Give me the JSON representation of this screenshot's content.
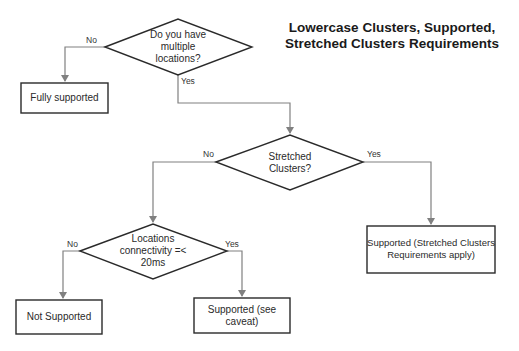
{
  "title": {
    "line1": "Lowercase Clusters, Supported,",
    "line2": "Stretched Clusters Requirements"
  },
  "colors": {
    "background": "#ffffff",
    "shape_stroke": "#2a2a2a",
    "connector": "#808080",
    "text": "#1a1a1a"
  },
  "nodes": {
    "q1": {
      "type": "decision",
      "lines": [
        "Do you have",
        "multiple",
        "locations?"
      ]
    },
    "fully_supported": {
      "type": "process",
      "lines": [
        "Fully supported"
      ]
    },
    "q2": {
      "type": "decision",
      "lines": [
        "Stretched",
        "Clusters?"
      ]
    },
    "supported_stretched": {
      "type": "process",
      "lines": [
        "Supported (Stretched Clusters",
        "Requirements apply)"
      ]
    },
    "q3": {
      "type": "decision",
      "lines": [
        "Locations",
        "connectivity =<",
        "20ms"
      ]
    },
    "not_supported": {
      "type": "process",
      "lines": [
        "Not Supported"
      ]
    },
    "supported_caveat": {
      "type": "process",
      "lines": [
        "Supported (see",
        "caveat)"
      ]
    }
  },
  "edges": [
    {
      "from": "q1",
      "to": "fully_supported",
      "label": "No"
    },
    {
      "from": "q1",
      "to": "q2",
      "label": "Yes"
    },
    {
      "from": "q2",
      "to": "q3",
      "label": "No"
    },
    {
      "from": "q2",
      "to": "supported_stretched",
      "label": "Yes"
    },
    {
      "from": "q3",
      "to": "not_supported",
      "label": "No"
    },
    {
      "from": "q3",
      "to": "supported_caveat",
      "label": "Yes"
    }
  ]
}
